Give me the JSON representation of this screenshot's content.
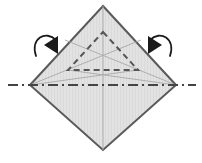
{
  "figure": {
    "canvas": {
      "width": 202,
      "height": 163
    },
    "colors": {
      "background": "#ffffff",
      "paper_fill": "#e2e2e2",
      "paper_stroke": "#5a5a5a",
      "crease_thin": "#a8a8a8",
      "dashed_fold": "#555555",
      "axis_line": "#444444",
      "arrow": "#1a1a1a"
    },
    "shapes": {
      "diamond": {
        "name": "paper-square-rotated",
        "points": "103,6 176,85 103,150 30,85",
        "vertices": {
          "top": [
            103,
            6
          ],
          "right": [
            176,
            85
          ],
          "bottom": [
            103,
            150
          ],
          "left": [
            30,
            85
          ]
        },
        "stroke_width": 2.0
      },
      "dashed_triangle": {
        "name": "inner-dashed-triangle",
        "points": "103,32 138,70 68,70",
        "apex": [
          103,
          32
        ],
        "base_left": [
          68,
          70
        ],
        "base_right": [
          138,
          70
        ],
        "dash_pattern": "6,4",
        "stroke_width": 2.0
      },
      "creases": [
        {
          "name": "crease-left-to-apex-right",
          "x1": 30,
          "y1": 85,
          "x2": 141,
          "y2": 40
        },
        {
          "name": "crease-right-to-apex-left",
          "x1": 176,
          "y1": 85,
          "x2": 65,
          "y2": 40
        },
        {
          "name": "crease-left-to-base-right",
          "x1": 30,
          "y1": 85,
          "x2": 138,
          "y2": 70
        },
        {
          "name": "crease-right-to-base-left",
          "x1": 176,
          "y1": 85,
          "x2": 68,
          "y2": 70
        },
        {
          "name": "crease-vertical-center",
          "x1": 103,
          "y1": 6,
          "x2": 103,
          "y2": 150
        }
      ],
      "fold_axis": {
        "name": "horizontal-fold-axis",
        "x1": 8,
        "y1": 85,
        "x2": 196,
        "y2": 85,
        "dash_pattern": "10,4,2,4",
        "stroke_width": 2.0,
        "extends_beyond_shape": true
      },
      "arrows": [
        {
          "name": "fold-arrow-left",
          "path": "M 36,56 C 30,38 46,30 56,40",
          "head_points": "58,36 58,54 44,45",
          "direction": "down-right"
        },
        {
          "name": "fold-arrow-right",
          "path": "M 170,56 C 176,38 160,30 150,40",
          "head_points": "148,36 148,54 162,45",
          "direction": "down-left"
        }
      ]
    }
  }
}
